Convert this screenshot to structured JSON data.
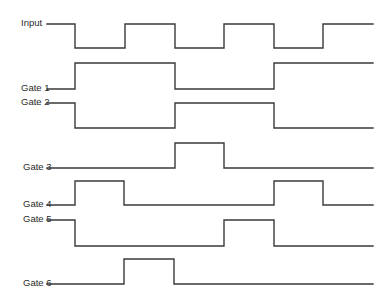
{
  "diagram": {
    "type": "timing-diagram",
    "x_start": 47,
    "x_end": 373,
    "signals": [
      {
        "label": "Input",
        "label_x": 21,
        "high_y": 24,
        "low_y": 48,
        "initial": "high",
        "transitions": [
          75,
          125,
          175,
          224,
          274,
          323
        ]
      },
      {
        "label": "Gate 1",
        "label_x": 21,
        "high_y": 63,
        "low_y": 89,
        "initial": "low",
        "transitions": [
          75,
          175,
          274
        ]
      },
      {
        "label": "Gate 2",
        "label_x": 21,
        "high_y": 103,
        "low_y": 128,
        "initial": "high",
        "transitions": [
          75,
          175,
          274
        ]
      },
      {
        "label": "Gate 3",
        "label_x": 23,
        "high_y": 143,
        "low_y": 168,
        "initial": "low",
        "transitions": [
          175,
          224
        ]
      },
      {
        "label": "Gate 4",
        "label_x": 23,
        "high_y": 181,
        "low_y": 205,
        "initial": "low",
        "transitions": [
          75,
          124,
          274,
          323
        ]
      },
      {
        "label": "Gate 5",
        "label_x": 23,
        "high_y": 220,
        "low_y": 246,
        "initial": "high",
        "transitions": [
          75,
          224,
          274
        ]
      },
      {
        "label": "Gate 6",
        "label_x": 23,
        "high_y": 259,
        "low_y": 284,
        "initial": "low",
        "transitions": [
          124,
          174
        ]
      }
    ],
    "line_color": "#3a3a3a"
  }
}
